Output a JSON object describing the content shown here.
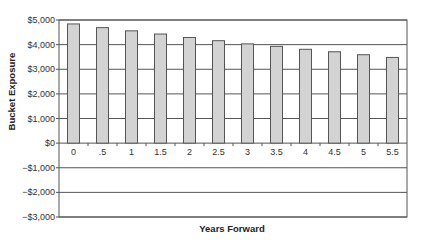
{
  "chart_data": {
    "type": "bar",
    "title": "",
    "xlabel": "Years Forward",
    "ylabel": "Bucket Exposure",
    "categories": [
      "0",
      ".5",
      "1",
      "1.5",
      "2",
      "2.5",
      "3",
      "3.5",
      "4",
      "4.5",
      "5",
      "5.5"
    ],
    "series": [
      {
        "name": "Bucket Exposure",
        "values": [
          4840,
          4690,
          4560,
          4430,
          4290,
          4160,
          4030,
          3930,
          3810,
          3710,
          3590,
          3480
        ]
      }
    ],
    "ylim": [
      -3000,
      5000
    ],
    "yticks": [
      5000,
      4000,
      3000,
      2000,
      1000,
      0,
      -1000,
      -2000,
      -3000
    ],
    "ytick_labels": [
      "$5,000",
      "$4,000",
      "$3,000",
      "$2,000",
      "$1,000",
      "$0",
      "−$1,000",
      "−$2,000",
      "−$3,000"
    ],
    "grid": true,
    "legend": false,
    "colors": {
      "bar_fill": "#d3d3d3",
      "bar_stroke": "#555555",
      "grid": "#555555",
      "axis": "#555555"
    }
  }
}
